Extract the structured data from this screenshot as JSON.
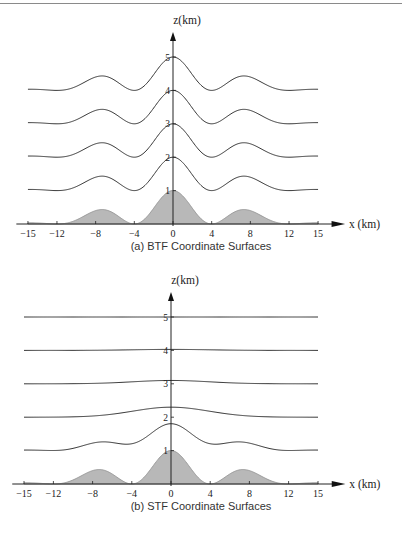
{
  "panels": [
    {
      "id": "a",
      "caption": "(a) BTF Coordinate Surfaces",
      "z_label": "z (km)",
      "x_label": "x (km)",
      "x_ticks": [
        "-15",
        "-12",
        "-8",
        "-4",
        "0",
        "4",
        "8",
        "12",
        "15"
      ],
      "z_ticks": [
        "1",
        "2",
        "3",
        "4",
        "5"
      ]
    },
    {
      "id": "b",
      "caption": "(b) STF Coordinate Surfaces",
      "z_label": "z (km)",
      "x_label": "x (km)",
      "x_ticks": [
        "-15",
        "-12",
        "-8",
        "-4",
        "0",
        "4",
        "8",
        "12",
        "15"
      ],
      "z_ticks": [
        "1",
        "2",
        "3",
        "4",
        "5"
      ]
    }
  ],
  "chart_data": [
    {
      "type": "line",
      "title": "(a) BTF Coordinate Surfaces",
      "xlabel": "x (km)",
      "ylabel": "z (km)",
      "xlim": [
        -15,
        15
      ],
      "ylim": [
        0,
        5
      ],
      "x_ticks": [
        -15,
        -12,
        -8,
        -4,
        0,
        4,
        8,
        12,
        15
      ],
      "z_ticks": [
        1,
        2,
        3,
        4,
        5
      ],
      "terrain": {
        "peaks_x": [
          -8,
          -4,
          0,
          4,
          8
        ],
        "peak_heights": [
          0.25,
          0.75,
          1.0,
          0.75,
          0.25
        ],
        "filled": true
      },
      "series": [
        {
          "name": "surface z=1",
          "base": 1,
          "terrain_amplitude": 1.0
        },
        {
          "name": "surface z=2",
          "base": 2,
          "terrain_amplitude": 1.0
        },
        {
          "name": "surface z=3",
          "base": 3,
          "terrain_amplitude": 1.0
        },
        {
          "name": "surface z=4",
          "base": 4,
          "terrain_amplitude": 1.0
        }
      ]
    },
    {
      "type": "line",
      "title": "(b) STF Coordinate Surfaces",
      "xlabel": "x (km)",
      "ylabel": "z (km)",
      "xlim": [
        -15,
        15
      ],
      "ylim": [
        0,
        5
      ],
      "x_ticks": [
        -15,
        -12,
        -8,
        -4,
        0,
        4,
        8,
        12,
        15
      ],
      "z_ticks": [
        1,
        2,
        3,
        4,
        5
      ],
      "terrain": {
        "peaks_x": [
          -8,
          -4,
          0,
          4,
          8
        ],
        "peak_heights": [
          0.25,
          0.75,
          1.0,
          0.75,
          0.25
        ],
        "filled": true
      },
      "series": [
        {
          "name": "surface z=1",
          "base": 1,
          "small_scale_amp": 0.35,
          "large_scale_amp": 0.3
        },
        {
          "name": "surface z=2",
          "base": 2,
          "small_scale_amp": 0.0,
          "large_scale_amp": 0.3
        },
        {
          "name": "surface z=3",
          "base": 3,
          "small_scale_amp": 0.0,
          "large_scale_amp": 0.1
        },
        {
          "name": "surface z=4",
          "base": 4,
          "small_scale_amp": 0.0,
          "large_scale_amp": 0.03
        },
        {
          "name": "surface z=5",
          "base": 5,
          "small_scale_amp": 0.0,
          "large_scale_amp": 0.0
        }
      ]
    }
  ]
}
